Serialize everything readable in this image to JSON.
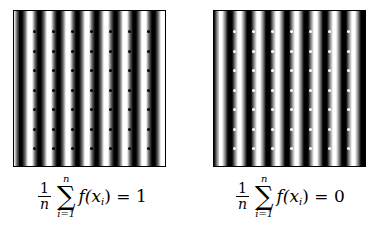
{
  "panels": [
    {
      "id": "left",
      "description": "vertical sinusoidal stripes with sample points on bright stripes",
      "dot_color": "#000000",
      "dot_on": "white stripes",
      "grid_cols": 7,
      "grid_rows": 7
    },
    {
      "id": "right",
      "description": "vertical sinusoidal stripes with sample points on dark stripes",
      "dot_color": "#ffffff",
      "dot_on": "black stripes",
      "grid_cols": 7,
      "grid_rows": 7
    }
  ],
  "formulas": [
    {
      "frac_num": "1",
      "frac_den": "n",
      "sum_upper": "n",
      "sum_sigma": "∑",
      "sum_lower": "i=1",
      "func": "f(x",
      "sub": "i",
      "close": ")",
      "equals": " = ",
      "result": "1"
    },
    {
      "frac_num": "1",
      "frac_den": "n",
      "sum_upper": "n",
      "sum_sigma": "∑",
      "sum_lower": "i=1",
      "func": "f(x",
      "sub": "i",
      "close": ")",
      "equals": " = ",
      "result": "0"
    }
  ],
  "colors": {
    "stripe_dark": "#000000",
    "stripe_light": "#ffffff",
    "background": "#ffffff"
  }
}
